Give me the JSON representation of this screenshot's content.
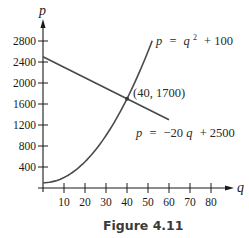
{
  "chart_data": {
    "type": "line",
    "title": "",
    "caption": "Figure 4.11",
    "xlabel": "q",
    "ylabel": "p",
    "xlim": [
      0,
      85
    ],
    "ylim": [
      0,
      3000
    ],
    "grid": false,
    "x_ticks": [
      10,
      20,
      30,
      40,
      50,
      60,
      70,
      80
    ],
    "y_ticks": [
      400,
      800,
      1200,
      1600,
      2000,
      2400,
      2800
    ],
    "series": [
      {
        "name": "supply",
        "equation": "p = q^2 + 100",
        "label_parts": {
          "lhs": "p",
          "eq": "=",
          "var": "q",
          "exp": "2",
          "rest": "+ 100"
        },
        "x": [
          0,
          5,
          10,
          15,
          20,
          25,
          30,
          35,
          40,
          45,
          50,
          52
        ],
        "values": [
          100,
          125,
          200,
          325,
          500,
          725,
          1000,
          1325,
          1700,
          2125,
          2600,
          2804
        ],
        "color": "#4a4a4a"
      },
      {
        "name": "demand",
        "equation": "p = -20q + 2500",
        "label_parts": {
          "lhs": "p",
          "eq": "=",
          "coef": "−20",
          "var": "q",
          "rest": "+ 2500"
        },
        "x": [
          0,
          60
        ],
        "values": [
          2500,
          1300
        ],
        "color": "#4a4a4a"
      }
    ],
    "annotations": [
      {
        "text": "(40, 1700)",
        "x": 40,
        "y": 1700,
        "type": "intersection-point"
      }
    ]
  }
}
